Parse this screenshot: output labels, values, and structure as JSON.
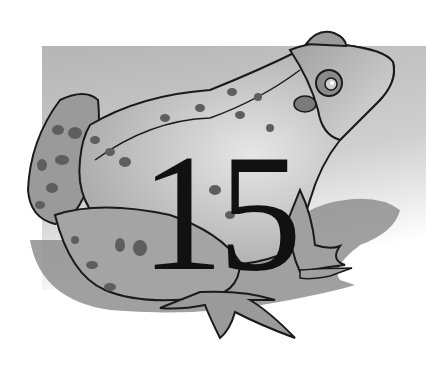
{
  "illustration": {
    "subject": "frog",
    "chapter_number": "15",
    "colors": {
      "background": "#ffffff",
      "panel": "#bdbdbd",
      "shadow": "#8f8f8f",
      "body": "#9a9a9a",
      "body_light": "#c9c9c9",
      "spots": "#5e5e5e",
      "outline": "#1a1a1a",
      "numeral": "#111111"
    }
  }
}
